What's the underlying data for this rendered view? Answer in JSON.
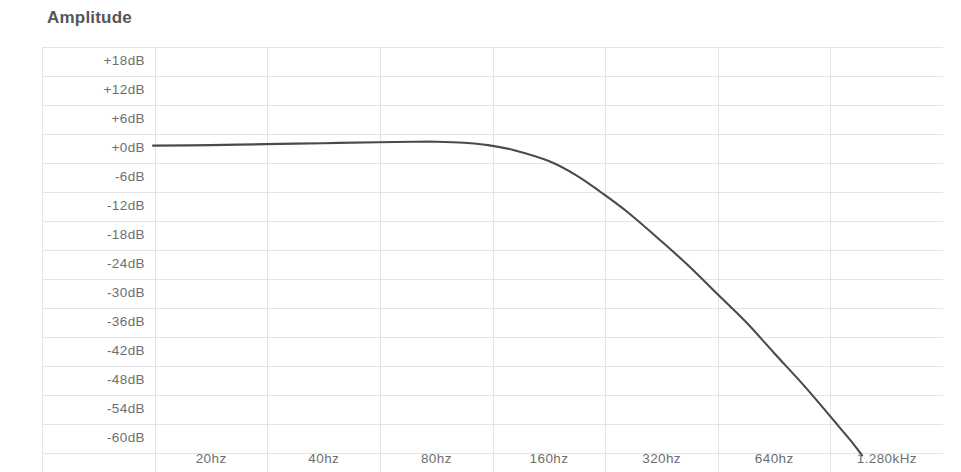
{
  "chart_data": {
    "type": "line",
    "title": "Amplitude",
    "xlabel": "",
    "ylabel": "Amplitude",
    "grid": true,
    "legend": false,
    "x_scale": "log2",
    "categories": [
      "20hz",
      "40hz",
      "80hz",
      "160hz",
      "320hz",
      "640hz",
      "1.280kHz"
    ],
    "x_tick_labels": [
      "20hz",
      "40hz",
      "80hz",
      "160hz",
      "320hz",
      "640hz",
      "1.280kHz"
    ],
    "y_tick_labels": [
      "+18dB",
      "+12dB",
      "+6dB",
      "+0dB",
      "-6dB",
      "-12dB",
      "-18dB",
      "-24dB",
      "-30dB",
      "-36dB",
      "-42dB",
      "-48dB",
      "-54dB",
      "-60dB"
    ],
    "y_tick_values": [
      18,
      12,
      6,
      0,
      -6,
      -12,
      -18,
      -24,
      -30,
      -36,
      -42,
      -48,
      -54,
      -60
    ],
    "ylim": [
      -63,
      21
    ],
    "xlim": [
      14,
      1810
    ],
    "series": [
      {
        "name": "Amplitude response",
        "color": "#4a4a4c",
        "points": [
          {
            "hz": 14,
            "db": 0.6
          },
          {
            "hz": 20,
            "db": 0.7
          },
          {
            "hz": 28,
            "db": 0.9
          },
          {
            "hz": 40,
            "db": 1.1
          },
          {
            "hz": 56,
            "db": 1.3
          },
          {
            "hz": 70,
            "db": 1.4
          },
          {
            "hz": 80,
            "db": 1.4
          },
          {
            "hz": 95,
            "db": 1.2
          },
          {
            "hz": 110,
            "db": 0.7
          },
          {
            "hz": 130,
            "db": -0.4
          },
          {
            "hz": 160,
            "db": -2.6
          },
          {
            "hz": 190,
            "db": -5.6
          },
          {
            "hz": 220,
            "db": -9.0
          },
          {
            "hz": 260,
            "db": -13.2
          },
          {
            "hz": 320,
            "db": -19.2
          },
          {
            "hz": 380,
            "db": -24.4
          },
          {
            "hz": 450,
            "db": -30.0
          },
          {
            "hz": 540,
            "db": -36.0
          },
          {
            "hz": 640,
            "db": -42.3
          },
          {
            "hz": 760,
            "db": -48.6
          },
          {
            "hz": 860,
            "db": -53.4
          },
          {
            "hz": 960,
            "db": -57.8
          },
          {
            "hz": 1040,
            "db": -61.0
          },
          {
            "hz": 1100,
            "db": -63.5
          }
        ]
      }
    ],
    "colors": {
      "curve": "#4a4a4c",
      "grid": "#e3e4e6",
      "tick_text": "#6d6e70",
      "title_text": "#555557",
      "background": "#ffffff"
    }
  }
}
